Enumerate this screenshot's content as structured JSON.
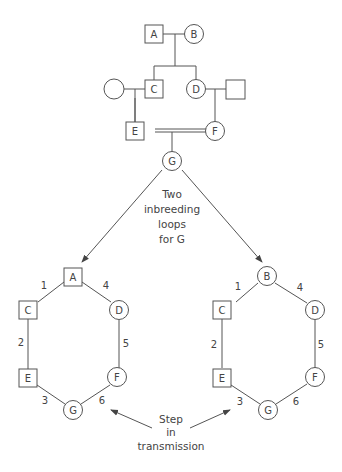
{
  "pedigree": {
    "individuals": {
      "A": {
        "label": "A",
        "sex": "male"
      },
      "B": {
        "label": "B",
        "sex": "female"
      },
      "C": {
        "label": "C",
        "sex": "male"
      },
      "D": {
        "label": "D",
        "sex": "female"
      },
      "C_spouse": {
        "label": "",
        "sex": "female"
      },
      "D_spouse": {
        "label": "",
        "sex": "male"
      },
      "E": {
        "label": "E",
        "sex": "male"
      },
      "F": {
        "label": "F",
        "sex": "female"
      },
      "G": {
        "label": "G",
        "sex": "female"
      }
    },
    "consanguineous_mating": "E = F"
  },
  "annotation_loops": {
    "line1": "Two",
    "line2": "inbreeding",
    "line3": "loops",
    "line4": "for G"
  },
  "loop_left": {
    "common_ancestor": "A",
    "nodes": {
      "top": "A",
      "c": "C",
      "d": "D",
      "e": "E",
      "f": "F",
      "g": "G"
    },
    "steps": [
      "1",
      "2",
      "3",
      "4",
      "5",
      "6"
    ]
  },
  "loop_right": {
    "common_ancestor": "B",
    "nodes": {
      "top": "B",
      "c": "C",
      "d": "D",
      "e": "E",
      "f": "F",
      "g": "G"
    },
    "steps": [
      "1",
      "2",
      "3",
      "4",
      "5",
      "6"
    ]
  },
  "annotation_step": {
    "line1": "Step",
    "line2": "in",
    "line3": "transmission"
  }
}
